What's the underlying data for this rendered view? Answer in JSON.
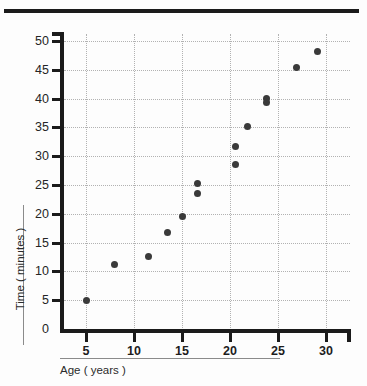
{
  "page": {
    "background_color": "#fdfdfd",
    "rule_color": "#1b1b1b",
    "top_rule_name": "top-divider"
  },
  "chart_data": {
    "type": "scatter",
    "title": "",
    "subtitle": "",
    "xlabel": "Age ( years )",
    "ylabel": "Time ( minutes )",
    "xlim": [
      0,
      32
    ],
    "ylim": [
      0,
      52
    ],
    "xticks": [
      5,
      10,
      15,
      20,
      25,
      30
    ],
    "xtick_labels": [
      "5",
      "10",
      "15",
      "20",
      "25",
      "30"
    ],
    "yticks": [
      0,
      5,
      10,
      15,
      20,
      25,
      30,
      35,
      40,
      45,
      50
    ],
    "ytick_labels": [
      "0",
      "5",
      "10",
      "15",
      "20",
      "25",
      "30",
      "35",
      "40",
      "45",
      "50"
    ],
    "grid": true,
    "grid_style": "dotted",
    "grid_color": "#b2b2b2",
    "legend": false,
    "legend_position": "none",
    "marker_color": "#3a3a3a",
    "marker_shape": "circle",
    "x": [
      5,
      8,
      11.5,
      13.5,
      15,
      16.6,
      16.6,
      20.6,
      20.6,
      21.8,
      23.8,
      23.8,
      26.9,
      29.1
    ],
    "y": [
      5,
      11.2,
      12.6,
      16.8,
      19.6,
      25.2,
      23.6,
      31.6,
      28.6,
      35.1,
      40,
      39.3,
      45.4,
      48.2
    ],
    "points": [
      {
        "x": 5,
        "y": 5
      },
      {
        "x": 8,
        "y": 11.2
      },
      {
        "x": 11.5,
        "y": 12.6
      },
      {
        "x": 13.5,
        "y": 16.8
      },
      {
        "x": 15,
        "y": 19.6
      },
      {
        "x": 16.6,
        "y": 25.2
      },
      {
        "x": 16.6,
        "y": 23.6
      },
      {
        "x": 20.6,
        "y": 31.6
      },
      {
        "x": 20.6,
        "y": 28.6
      },
      {
        "x": 21.8,
        "y": 35.1
      },
      {
        "x": 23.8,
        "y": 40.0
      },
      {
        "x": 23.8,
        "y": 39.3
      },
      {
        "x": 26.9,
        "y": 45.4
      },
      {
        "x": 29.1,
        "y": 48.2
      }
    ]
  }
}
